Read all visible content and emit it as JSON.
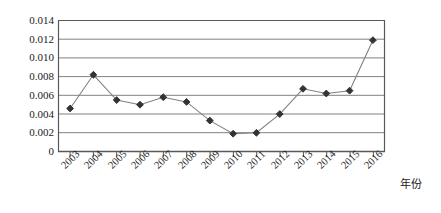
{
  "chart_data": {
    "type": "line",
    "title": "",
    "subtitle": "",
    "xlabel": "年份",
    "ylabel": "",
    "categories": [
      "2003",
      "2004",
      "2005",
      "2006",
      "2007",
      "2008",
      "2009",
      "2010",
      "2011",
      "2012",
      "2013",
      "2014",
      "2015",
      "2016"
    ],
    "values": [
      0.0046,
      0.0082,
      0.0055,
      0.005,
      0.0058,
      0.0053,
      0.0033,
      0.0019,
      0.002,
      0.004,
      0.0067,
      0.0062,
      0.0065,
      0.0119
    ],
    "series": [
      {
        "name": "series-1",
        "values": [
          0.0046,
          0.0082,
          0.0055,
          0.005,
          0.0058,
          0.0053,
          0.0033,
          0.0019,
          0.002,
          0.004,
          0.0067,
          0.0062,
          0.0065,
          0.0119
        ]
      }
    ],
    "ylim": [
      0,
      0.014
    ],
    "yticks": [
      0,
      0.002,
      0.004,
      0.006,
      0.008,
      0.01,
      0.012,
      0.014
    ],
    "ytick_labels": [
      "0",
      "0.002",
      "0.004",
      "0.006",
      "0.008",
      "0.010",
      "0.012",
      "0.014"
    ],
    "xtick_labels": [
      "2003",
      "2004",
      "2005",
      "2006",
      "2007",
      "2008",
      "2009",
      "2010",
      "2011",
      "2012",
      "2013",
      "2014",
      "2015",
      "2016"
    ],
    "grid": true,
    "grid_axis": "y",
    "legend": false,
    "legend_position": "none",
    "marker": "diamond",
    "marker_color": "#333333",
    "line_color": "#808080",
    "grid_color": "#808080",
    "axis_color": "#595959",
    "annotations": []
  }
}
